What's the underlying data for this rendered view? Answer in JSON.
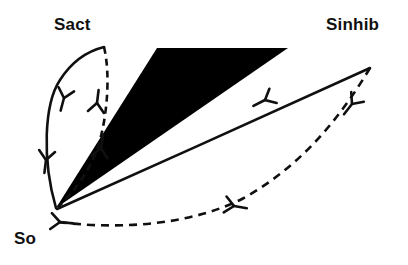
{
  "figure": {
    "name": "signal-activation-inhibition-diagram",
    "background_color": "#ffffff",
    "stroke_color": "#101010",
    "fill_color": "#000000",
    "width": 408,
    "height": 265
  },
  "labels": {
    "source": "So",
    "activator": "Sact",
    "inhibitor": "Sinhib"
  },
  "nodes": [
    {
      "id": "so",
      "label": "So",
      "x": 56,
      "y": 208
    },
    {
      "id": "sact",
      "label": "Sact",
      "x": 78,
      "y": 32
    },
    {
      "id": "sinhib",
      "label": "Sinhib",
      "x": 358,
      "y": 32
    }
  ],
  "wedge": {
    "name": "black-wedge",
    "description": "filled black triangle from So toward upper right",
    "points": "56,208 157,48 288,48",
    "fill": "#000000"
  },
  "edges": [
    {
      "id": "so-to-sact-solid",
      "style": "solid",
      "from": "so",
      "to": "sact",
      "path": "M 56,208 C 42,160 44,104 60,80 C 74,58 92,50 104,47",
      "arrowheads": 2
    },
    {
      "id": "sact-to-so-dashed",
      "style": "dashed",
      "from": "sact",
      "to": "so",
      "path": "M 104,47 C 110,72 108,110 100,140 C 92,170 72,194 58,207",
      "arrowheads": 2
    },
    {
      "id": "so-to-sinhib-solid",
      "style": "solid",
      "from": "so",
      "to": "sinhib",
      "path": "M 57,209 C 150,168 290,104 370,68",
      "arrowheads": 1
    },
    {
      "id": "sinhib-to-so-dashed",
      "style": "dashed",
      "from": "sinhib",
      "to": "so",
      "path": "M 370,68 C 340,118 300,168 240,200 C 180,229 104,228 58,222",
      "arrowheads": 2
    }
  ],
  "arrow_markers": [
    {
      "id": "sact-solid-upper",
      "x": 64,
      "y": 98,
      "angle": -75
    },
    {
      "id": "sact-solid-lower",
      "x": 46,
      "y": 160,
      "angle": -83
    },
    {
      "id": "sact-dashed-upper",
      "x": 97,
      "y": 103,
      "angle": 97
    },
    {
      "id": "sact-dashed-lower",
      "x": 101,
      "y": 148,
      "angle": 100
    },
    {
      "id": "sinhib-solid-mid",
      "x": 265,
      "y": 100,
      "angle": -27
    },
    {
      "id": "sinhib-dashed-mid",
      "x": 352,
      "y": 104,
      "angle": -52
    },
    {
      "id": "so-dashed-mid",
      "x": 234,
      "y": 206,
      "angle": 190
    },
    {
      "id": "so-dashed-end",
      "x": 60,
      "y": 222,
      "angle": 186
    }
  ]
}
